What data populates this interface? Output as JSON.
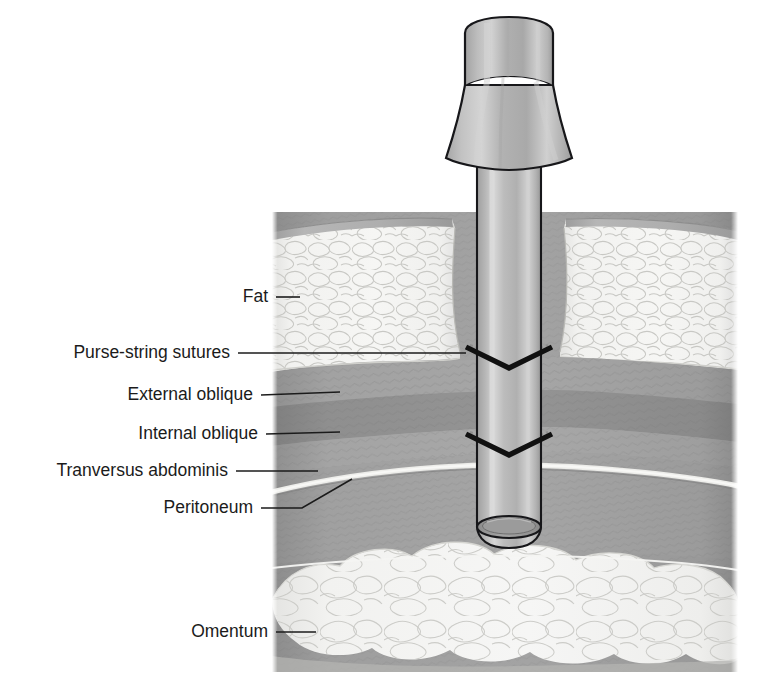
{
  "figure": {
    "type": "medical-cross-section-illustration",
    "background_color": "#ffffff",
    "width": 758,
    "height": 687
  },
  "labels": [
    {
      "id": "fat",
      "text": "Fat",
      "text_x": 268,
      "text_y": 297,
      "leader": "M 276 297 L 300 297",
      "target": "fat-layer"
    },
    {
      "id": "purse-string-sutures",
      "text": "Purse-string sutures",
      "text_x": 230,
      "text_y": 353,
      "leader": "M 238 353 L 466 353",
      "target": "upper-suture"
    },
    {
      "id": "external-oblique",
      "text": "External oblique",
      "text_x": 253,
      "text_y": 395,
      "leader": "M 261 395 L 340 392",
      "target": "external-oblique-layer"
    },
    {
      "id": "internal-oblique",
      "text": "Internal oblique",
      "text_x": 258,
      "text_y": 434,
      "leader": "M 266 434 L 340 432",
      "target": "internal-oblique-layer"
    },
    {
      "id": "tranversus-abdominis",
      "text": "Tranversus abdominis",
      "text_x": 228,
      "text_y": 471,
      "leader": "M 236 471 L 318 471",
      "target": "transversus-abdominis-layer"
    },
    {
      "id": "peritoneum",
      "text": "Peritoneum",
      "text_x": 253,
      "text_y": 508,
      "leader": "M 261 508 L 302 508 L 352 479",
      "target": "peritoneum-line"
    },
    {
      "id": "omentum",
      "text": "Omentum",
      "text_x": 268,
      "text_y": 632,
      "leader": "M 276 632 L 316 632",
      "target": "omentum-layer"
    }
  ],
  "anatomy_layers": [
    {
      "id": "skin",
      "name": "Skin",
      "color": "#a9a9a9"
    },
    {
      "id": "fat",
      "name": "Fat",
      "color": "#f0f0ee",
      "texture": "lobules"
    },
    {
      "id": "external-oblique",
      "name": "External oblique",
      "color": "#9a9a9a"
    },
    {
      "id": "internal-oblique",
      "name": "Internal oblique",
      "color": "#8b8b8b"
    },
    {
      "id": "transversus-abdominis",
      "name": "Tranversus abdominis",
      "color": "#9e9e9e"
    },
    {
      "id": "peritoneum",
      "name": "Peritoneum",
      "color": "#e8e8e6"
    },
    {
      "id": "preperitoneal",
      "name": "Preperitoneal space",
      "color": "#9d9d9d"
    },
    {
      "id": "omentum",
      "name": "Omentum",
      "color": "#efefed",
      "texture": "lobules"
    }
  ],
  "instrument": {
    "name": "Trocar cannula",
    "parts": [
      {
        "id": "cap",
        "name": "Trocar cap",
        "color": "#b4b4b4"
      },
      {
        "id": "hub",
        "name": "Conical hub",
        "color": "#b8b8b8"
      },
      {
        "id": "shaft",
        "name": "Cannula shaft",
        "color": "#bdbdbd"
      },
      {
        "id": "tip",
        "name": "Open cannula tip",
        "color": "#9a9a9a"
      }
    ]
  },
  "sutures": [
    {
      "id": "upper-suture",
      "name": "Upper purse-string suture",
      "level": "fascia",
      "color": "#111111"
    },
    {
      "id": "lower-suture",
      "name": "Lower purse-string suture",
      "level": "peritoneum",
      "color": "#111111"
    }
  ]
}
